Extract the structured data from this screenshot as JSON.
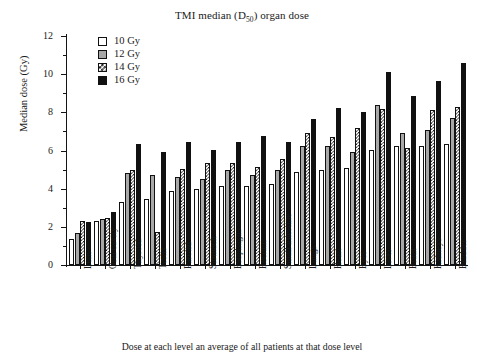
{
  "chart_data": {
    "type": "bar",
    "title": "TMI median (D50) organ dose",
    "title_main": "TMI median (D",
    "title_sub": "50",
    "title_tail": ") organ dose",
    "xlabel": "Dose at each level an average of all patients at that dose level",
    "ylabel": "Median dose (Gy)",
    "ylim": [
      0,
      12
    ],
    "yticks": [
      0,
      2,
      4,
      6,
      8,
      10,
      12
    ],
    "ytick_labels": [
      "0",
      "2",
      "4",
      "6",
      "8",
      "10",
      "12"
    ],
    "grid": false,
    "legend_position": "top-left",
    "categories": [
      "Lens",
      "Oral cavity",
      "Thyroid",
      "Testis",
      "Parotid",
      "Stomach",
      "Esophagus",
      "Rectum",
      "Small intestine",
      "Lungs",
      "Heart",
      "Eyes",
      "Liver",
      "Brain",
      "Kidneys",
      "Bladder"
    ],
    "series": [
      {
        "name": "10 Gy",
        "fill": "white",
        "color": "#ffffff",
        "values": [
          1.35,
          2.3,
          3.3,
          3.45,
          3.9,
          4.0,
          4.15,
          4.15,
          4.25,
          4.9,
          5.0,
          5.1,
          6.05,
          6.25,
          6.25,
          6.35
        ]
      },
      {
        "name": "12 Gy",
        "fill": "gray",
        "color": "#a8a8a8",
        "values": [
          1.7,
          2.4,
          4.8,
          4.7,
          4.6,
          4.5,
          5.0,
          4.7,
          5.0,
          6.25,
          6.25,
          5.9,
          8.4,
          6.9,
          7.1,
          7.7
        ]
      },
      {
        "name": "14 Gy",
        "fill": "checkered",
        "color": "#ffffff",
        "values": [
          2.3,
          2.45,
          5.0,
          1.75,
          5.05,
          5.35,
          5.35,
          5.15,
          5.55,
          6.9,
          6.7,
          7.2,
          8.2,
          6.15,
          8.1,
          8.3
        ]
      },
      {
        "name": "16 Gy",
        "fill": "black",
        "color": "#111111",
        "values": [
          2.25,
          2.8,
          6.35,
          5.9,
          6.45,
          6.05,
          6.45,
          6.75,
          6.45,
          7.65,
          8.25,
          8.0,
          10.1,
          8.85,
          9.65,
          10.6
        ]
      }
    ]
  }
}
